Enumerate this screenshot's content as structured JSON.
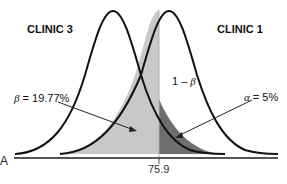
{
  "figure": {
    "panel_label": "A",
    "curves": [
      {
        "name": "CLINIC 3",
        "label": "CLINIC 3",
        "peak_x_px": 113
      },
      {
        "name": "CLINIC 1",
        "label": "CLINIC 1",
        "peak_x_px": 169
      }
    ],
    "cutoff": {
      "value_label": "75.9"
    },
    "annotations": {
      "beta": {
        "symbol": "β",
        "text": " = 19.77%"
      },
      "power": {
        "prefix": "1 – ",
        "symbol": "β"
      },
      "alpha": {
        "symbol": "α",
        "text": " = 5%"
      }
    },
    "colors": {
      "curve": "#111111",
      "beta_region": "#c8c8c8",
      "alpha_region": "#6e6e6e",
      "axis": "#555555"
    }
  }
}
